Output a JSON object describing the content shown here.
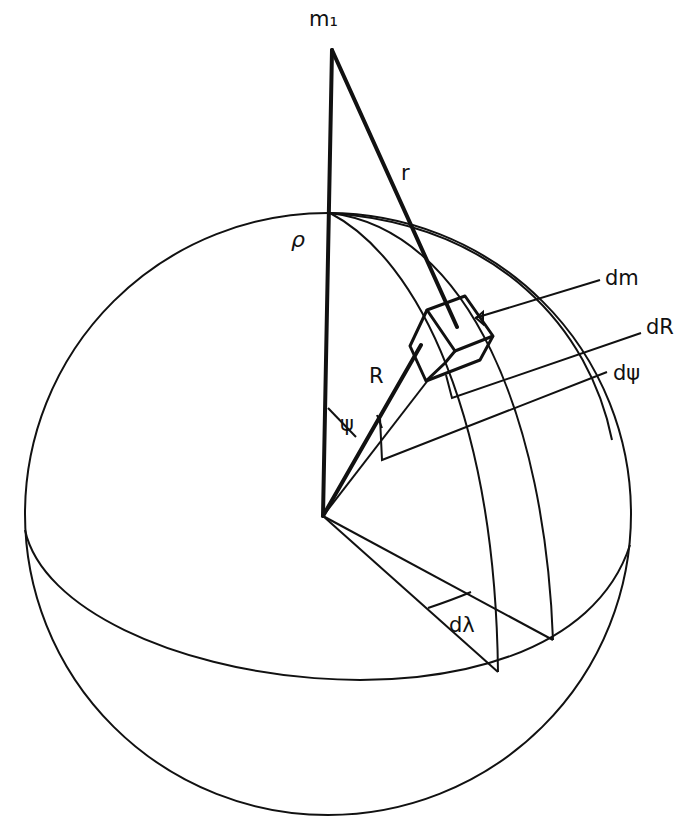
{
  "figure": {
    "labels": {
      "point_mass": "m₁",
      "distance": "r",
      "pole_distance": "ρ",
      "radius": "R",
      "polar_angle": "ψ",
      "mass_element": "dm",
      "radial_increment": "dR",
      "angular_increment": "dψ",
      "azimuth_increment": "dλ"
    },
    "colors": {
      "ink": "#111111",
      "background": "#ffffff"
    }
  }
}
